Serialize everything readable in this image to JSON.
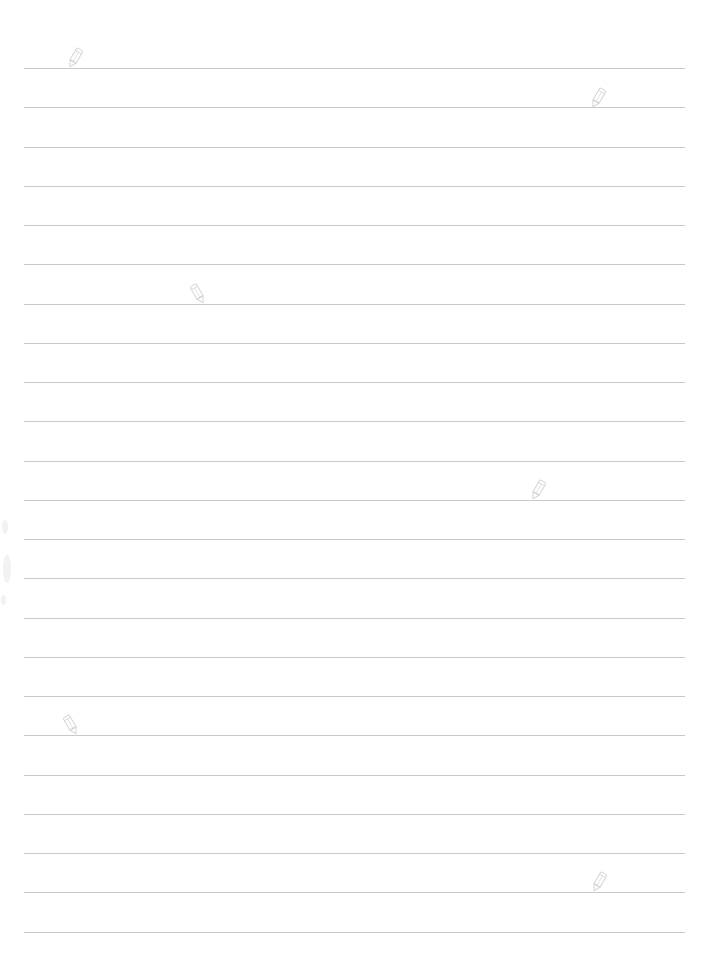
{
  "page": {
    "type": "lined-paper",
    "background_color": "#ffffff",
    "rule_color": "#c9c9c9",
    "rule_left": 24,
    "rule_right": 685,
    "first_rule_y": 68,
    "rule_spacing": 39.25,
    "rule_count": 23
  },
  "decorations": {
    "pencil_icons": [
      {
        "x": 70,
        "y": 47,
        "tilt": "left"
      },
      {
        "x": 593,
        "y": 87,
        "tilt": "left"
      },
      {
        "x": 193,
        "y": 283,
        "tilt": "right"
      },
      {
        "x": 533,
        "y": 479,
        "tilt": "left"
      },
      {
        "x": 66,
        "y": 714,
        "tilt": "right"
      },
      {
        "x": 594,
        "y": 871,
        "tilt": "left"
      }
    ],
    "pencil_color": "#d4d4d4"
  }
}
